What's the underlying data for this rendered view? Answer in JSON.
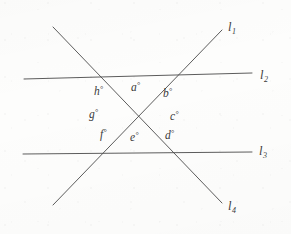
{
  "figure": {
    "background_color": "#fdfdfc",
    "stroke_color": "#4a4a4a",
    "text_color": "#3a3a3a",
    "center_point": {
      "x": 139,
      "y": 117
    },
    "lines": [
      {
        "id": "line-1",
        "label": "l",
        "subscript": "1",
        "x1": 53,
        "y1": 205,
        "x2": 222,
        "y2": 30,
        "label_x": 228,
        "label_y": 21
      },
      {
        "id": "line-2",
        "label": "l",
        "subscript": "2",
        "x1": 24,
        "y1": 79,
        "x2": 252,
        "y2": 73,
        "label_x": 260,
        "label_y": 69
      },
      {
        "id": "line-3",
        "label": "l",
        "subscript": "3",
        "x1": 23,
        "y1": 154,
        "x2": 252,
        "y2": 152,
        "label_x": 259,
        "label_y": 145
      },
      {
        "id": "line-4",
        "label": "l",
        "subscript": "4",
        "x1": 53,
        "y1": 27,
        "x2": 222,
        "y2": 203,
        "label_x": 228,
        "label_y": 200
      }
    ],
    "angles": [
      {
        "id": "angle-a",
        "label": "a",
        "degree_symbol": "°",
        "x": 131,
        "y": 81
      },
      {
        "id": "angle-b",
        "label": "b",
        "degree_symbol": "°",
        "x": 163,
        "y": 87
      },
      {
        "id": "angle-c",
        "label": "c",
        "degree_symbol": "°",
        "x": 170,
        "y": 110
      },
      {
        "id": "angle-d",
        "label": "d",
        "degree_symbol": "°",
        "x": 165,
        "y": 129
      },
      {
        "id": "angle-e",
        "label": "e",
        "degree_symbol": "°",
        "x": 130,
        "y": 131
      },
      {
        "id": "angle-f",
        "label": "f",
        "degree_symbol": "°",
        "x": 100,
        "y": 128
      },
      {
        "id": "angle-g",
        "label": "g",
        "degree_symbol": "°",
        "x": 89,
        "y": 108
      },
      {
        "id": "angle-h",
        "label": "h",
        "degree_symbol": "°",
        "x": 94,
        "y": 85
      }
    ]
  }
}
